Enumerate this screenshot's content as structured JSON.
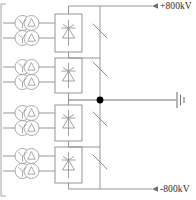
{
  "diagram": {
    "name": "hvdc-converter-station-single-line-diagram",
    "type": "electrical-single-line-diagram",
    "background_color": "#ffffff",
    "line_color": "#8a8a8a",
    "node_color": "#000000",
    "text_color": "#2b2b2b",
    "terminals": [
      {
        "id": "positive-pole",
        "label": "+800kV",
        "position": "top-right",
        "arrow_direction": "left",
        "y": 11
      },
      {
        "id": "negative-pole",
        "label": "-800kV",
        "position": "bottom-right",
        "arrow_direction": "left",
        "y": 188
      }
    ],
    "neutral": {
      "id": "neutral-ground",
      "label": "",
      "icon": "ground-icon",
      "junction_icon": "junction-dot-icon",
      "y": 100
    },
    "converter_groups": [
      {
        "id": "converter-group-1",
        "index": 1,
        "block_icon": "thyristor-valve-icon",
        "switch_icon": "bypass-switch-icon",
        "transformers": [
          {
            "id": "transformer-1a",
            "icon": "converter-transformer-icon",
            "winding": "wye-delta"
          },
          {
            "id": "transformer-1b",
            "icon": "converter-transformer-icon",
            "winding": "wye-wye"
          }
        ]
      },
      {
        "id": "converter-group-2",
        "index": 2,
        "block_icon": "thyristor-valve-icon",
        "switch_icon": "bypass-switch-icon",
        "transformers": [
          {
            "id": "transformer-2a",
            "icon": "converter-transformer-icon",
            "winding": "wye-delta"
          },
          {
            "id": "transformer-2b",
            "icon": "converter-transformer-icon",
            "winding": "wye-wye"
          }
        ]
      },
      {
        "id": "converter-group-3",
        "index": 3,
        "block_icon": "thyristor-valve-icon",
        "switch_icon": "bypass-switch-icon",
        "transformers": [
          {
            "id": "transformer-3a",
            "icon": "converter-transformer-icon",
            "winding": "wye-delta"
          },
          {
            "id": "transformer-3b",
            "icon": "converter-transformer-icon",
            "winding": "wye-wye"
          }
        ]
      },
      {
        "id": "converter-group-4",
        "index": 4,
        "block_icon": "thyristor-valve-icon",
        "switch_icon": "bypass-switch-icon",
        "transformers": [
          {
            "id": "transformer-4a",
            "icon": "converter-transformer-icon",
            "winding": "wye-delta"
          },
          {
            "id": "transformer-4b",
            "icon": "converter-transformer-icon",
            "winding": "wye-wye"
          }
        ]
      }
    ]
  }
}
